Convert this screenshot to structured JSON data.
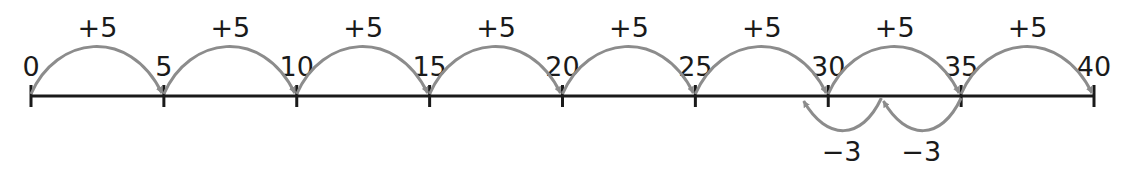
{
  "number_line": {
    "start": 0,
    "end": 40,
    "step": 5,
    "tick_labels": [
      "0",
      "5",
      "10",
      "15",
      "20",
      "25",
      "30",
      "35",
      "40"
    ],
    "line_color": "#1a1a1a",
    "arc_color": "#8c8c8c"
  },
  "forward_jumps": [
    {
      "from": 0,
      "to": 5,
      "label": "+5"
    },
    {
      "from": 5,
      "to": 10,
      "label": "+5"
    },
    {
      "from": 10,
      "to": 15,
      "label": "+5"
    },
    {
      "from": 15,
      "to": 20,
      "label": "+5"
    },
    {
      "from": 20,
      "to": 25,
      "label": "+5"
    },
    {
      "from": 25,
      "to": 30,
      "label": "+5"
    },
    {
      "from": 30,
      "to": 35,
      "label": "+5"
    },
    {
      "from": 35,
      "to": 40,
      "label": "+5"
    }
  ],
  "backward_jumps": [
    {
      "from": 35,
      "to": 32,
      "label": "−3"
    },
    {
      "from": 32,
      "to": 29,
      "label": "−3"
    }
  ]
}
